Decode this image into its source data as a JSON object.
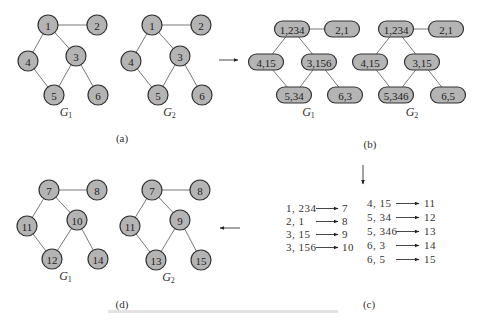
{
  "panels": {
    "a": {
      "caption": "(a)",
      "graphs": [
        {
          "name": "G",
          "sub": "1",
          "nodes": [
            {
              "id": "1",
              "x": 48,
              "y": 25
            },
            {
              "id": "2",
              "x": 97,
              "y": 25
            },
            {
              "id": "3",
              "x": 76,
              "y": 56
            },
            {
              "id": "4",
              "x": 28,
              "y": 61
            },
            {
              "id": "5",
              "x": 54,
              "y": 95
            },
            {
              "id": "6",
              "x": 98,
              "y": 95
            }
          ],
          "edges": [
            [
              "1",
              "2"
            ],
            [
              "1",
              "4"
            ],
            [
              "1",
              "3"
            ],
            [
              "4",
              "5"
            ],
            [
              "3",
              "5"
            ],
            [
              "3",
              "6"
            ]
          ]
        },
        {
          "name": "G",
          "sub": "2",
          "nodes": [
            {
              "id": "1",
              "x": 152,
              "y": 25
            },
            {
              "id": "2",
              "x": 201,
              "y": 25
            },
            {
              "id": "3",
              "x": 180,
              "y": 56
            },
            {
              "id": "4",
              "x": 131,
              "y": 61
            },
            {
              "id": "5",
              "x": 158,
              "y": 95
            },
            {
              "id": "6",
              "x": 202,
              "y": 95
            }
          ],
          "edges": [
            [
              "1",
              "2"
            ],
            [
              "1",
              "4"
            ],
            [
              "1",
              "3"
            ],
            [
              "4",
              "5"
            ],
            [
              "3",
              "5"
            ],
            [
              "3",
              "6"
            ]
          ]
        }
      ]
    },
    "b": {
      "caption": "(b)",
      "graphs": [
        {
          "name": "G",
          "sub": "1",
          "nodes": [
            {
              "id": "1,234",
              "x": 292,
              "y": 29
            },
            {
              "id": "2,1",
              "x": 342,
              "y": 29
            },
            {
              "id": "4,15",
              "x": 266,
              "y": 62
            },
            {
              "id": "3,156",
              "x": 319,
              "y": 62
            },
            {
              "id": "5,34",
              "x": 294,
              "y": 95
            },
            {
              "id": "6,3",
              "x": 345,
              "y": 95
            }
          ],
          "edges": [
            [
              "1,234",
              "2,1"
            ],
            [
              "1,234",
              "4,15"
            ],
            [
              "1,234",
              "3,156"
            ],
            [
              "4,15",
              "5,34"
            ],
            [
              "3,156",
              "5,34"
            ],
            [
              "3,156",
              "6,3"
            ]
          ]
        },
        {
          "name": "G",
          "sub": "2",
          "nodes": [
            {
              "id": "1,234",
              "x": 396,
              "y": 29
            },
            {
              "id": "2,1",
              "x": 446,
              "y": 29
            },
            {
              "id": "4,15",
              "x": 370,
              "y": 62
            },
            {
              "id": "3,15",
              "x": 422,
              "y": 62
            },
            {
              "id": "5,346",
              "x": 396,
              "y": 95
            },
            {
              "id": "6,5",
              "x": 448,
              "y": 95
            }
          ],
          "edges": [
            [
              "1,234",
              "2,1"
            ],
            [
              "1,234",
              "4,15"
            ],
            [
              "1,234",
              "3,15"
            ],
            [
              "4,15",
              "5,346"
            ],
            [
              "3,15",
              "5,346"
            ],
            [
              "3,15",
              "6,5"
            ]
          ]
        }
      ]
    },
    "c": {
      "caption": "(c)",
      "left_column": [
        {
          "from": "1,234",
          "to": "7"
        },
        {
          "from": "2,1",
          "to": "8"
        },
        {
          "from": "3,15",
          "to": "9"
        },
        {
          "from": "3,156",
          "to": "10"
        }
      ],
      "right_column": [
        {
          "from": "4,15",
          "to": "11"
        },
        {
          "from": "5,34",
          "to": "12"
        },
        {
          "from": "5,346",
          "to": "13"
        },
        {
          "from": "6,3",
          "to": "14"
        },
        {
          "from": "6,5",
          "to": "15"
        }
      ]
    },
    "d": {
      "caption": "(d)",
      "graphs": [
        {
          "name": "G",
          "sub": "1",
          "nodes": [
            {
              "id": "7",
              "x": 49,
              "y": 190
            },
            {
              "id": "8",
              "x": 97,
              "y": 190
            },
            {
              "id": "10",
              "x": 77,
              "y": 220
            },
            {
              "id": "11",
              "x": 27,
              "y": 226
            },
            {
              "id": "12",
              "x": 52,
              "y": 259
            },
            {
              "id": "14",
              "x": 98,
              "y": 259
            }
          ],
          "edges": [
            [
              "7",
              "8"
            ],
            [
              "7",
              "11"
            ],
            [
              "7",
              "10"
            ],
            [
              "11",
              "12"
            ],
            [
              "10",
              "12"
            ],
            [
              "10",
              "14"
            ]
          ]
        },
        {
          "name": "G",
          "sub": "2",
          "nodes": [
            {
              "id": "7",
              "x": 152,
              "y": 190
            },
            {
              "id": "8",
              "x": 200,
              "y": 190
            },
            {
              "id": "9",
              "x": 180,
              "y": 220
            },
            {
              "id": "11",
              "x": 130,
              "y": 226
            },
            {
              "id": "13",
              "x": 156,
              "y": 260
            },
            {
              "id": "15",
              "x": 201,
              "y": 260
            }
          ],
          "edges": [
            [
              "7",
              "8"
            ],
            [
              "7",
              "11"
            ],
            [
              "7",
              "9"
            ],
            [
              "11",
              "13"
            ],
            [
              "9",
              "13"
            ],
            [
              "9",
              "15"
            ]
          ]
        }
      ]
    }
  },
  "arrows": [
    {
      "name": "a-to-b",
      "x1": 219,
      "y1": 60,
      "x2": 238,
      "y2": 60
    },
    {
      "name": "b-to-c",
      "x1": 363,
      "y1": 165,
      "x2": 363,
      "y2": 184
    },
    {
      "name": "c-to-d",
      "x1": 240,
      "y1": 228,
      "x2": 220,
      "y2": 228
    }
  ]
}
